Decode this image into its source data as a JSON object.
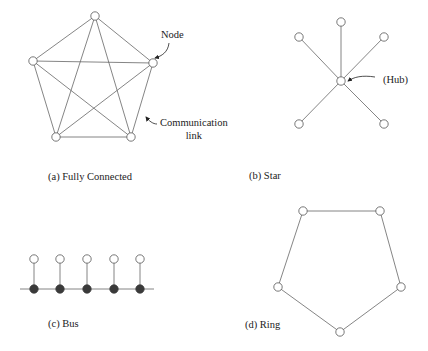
{
  "diagrams": {
    "fully_connected": {
      "caption": "(a) Fully Connected",
      "node_label": "Node",
      "link_label_line1": "Communication",
      "link_label_line2": "link",
      "nodes": [
        [
          95,
          16
        ],
        [
          153,
          63
        ],
        [
          131,
          137
        ],
        [
          56,
          137
        ],
        [
          33,
          61
        ]
      ]
    },
    "star": {
      "caption": "(b) Star",
      "hub_label": "(Hub)",
      "hub": [
        341,
        81
      ],
      "nodes": [
        [
          341,
          22
        ],
        [
          384,
          37
        ],
        [
          384,
          124
        ],
        [
          299,
          124
        ],
        [
          299,
          37
        ]
      ]
    },
    "bus": {
      "caption": "(c) Bus",
      "node_x": [
        34,
        60,
        87,
        114,
        140
      ],
      "open_y": 259,
      "tap_y": 289,
      "line": [
        20,
        154
      ]
    },
    "ring": {
      "caption": "(d) Ring",
      "nodes": [
        [
          303,
          211
        ],
        [
          380,
          211
        ],
        [
          401,
          287
        ],
        [
          340,
          332
        ],
        [
          278,
          287
        ]
      ]
    }
  },
  "colors": {
    "line": "#666666",
    "node_fill": "#ffffff",
    "node_stroke": "#555555",
    "tap_fill": "#3a3a3a",
    "text": "#222222"
  }
}
